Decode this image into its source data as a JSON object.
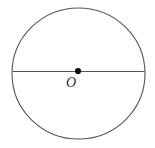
{
  "figure": {
    "type": "geometry-diagram",
    "background_color": "#ffffff",
    "stroke_color": "#555555",
    "point_color": "#111111",
    "label_color": "#2b2b2b",
    "canvas": {
      "width": 155,
      "height": 148
    },
    "circle": {
      "name": "circle-outline",
      "center_x": 78.5,
      "center_y": 73.5,
      "radius_x": 66.5,
      "radius_y": 65.5,
      "stroke_width": 1.1
    },
    "diameter": {
      "name": "horizontal-diameter",
      "x1": 12.5,
      "y1": 71.5,
      "x2": 144.5,
      "y2": 71.5,
      "stroke_width": 1.1
    },
    "center_point": {
      "name": "center-point",
      "cx": 78,
      "cy": 71,
      "radius": 3.1
    },
    "center_label": {
      "text": "O",
      "x": 66,
      "y": 76,
      "font_size": 14
    }
  }
}
